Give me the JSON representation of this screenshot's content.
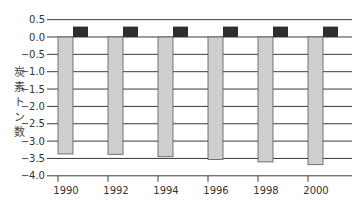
{
  "chart_data": {
    "type": "bar",
    "title": "",
    "xlabel": "",
    "ylabel": "炭素トン数",
    "ylim": [
      -4.0,
      0.5
    ],
    "yticks": [
      0.5,
      0.0,
      -0.5,
      -1.0,
      -1.5,
      -2.0,
      -2.5,
      -3.0,
      -3.5,
      -4.0
    ],
    "ytick_labels": [
      "0.5",
      "0.0",
      "−0.5",
      "−1.0",
      "−1.5",
      "−2.0",
      "−2.5",
      "−3.0",
      "−3.5",
      "−4.0"
    ],
    "grid": true,
    "legend": null,
    "categories": [
      "1990",
      "1992",
      "1994",
      "1996",
      "1998",
      "2000"
    ],
    "series": [
      {
        "name": "negative (light grey)",
        "color": "#cfcfcf",
        "values": [
          -3.37,
          -3.38,
          -3.45,
          -3.53,
          -3.6,
          -3.68
        ]
      },
      {
        "name": "positive (dark)",
        "color": "#2e2e2e",
        "values": [
          0.3,
          0.3,
          0.3,
          0.3,
          0.3,
          0.3
        ]
      }
    ]
  },
  "ylabel_chars": [
    "炭",
    "素",
    "ト",
    "ン",
    "数"
  ]
}
